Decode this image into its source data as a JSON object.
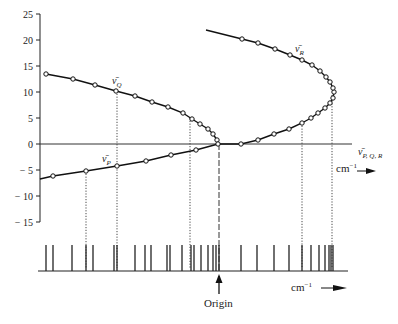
{
  "chart_data": {
    "type": "line",
    "title": "",
    "xlabel": "ν̄ P, Q, R  (cm⁻¹ →)",
    "ylabel": "",
    "ylim": [
      -15,
      25
    ],
    "y_ticks": [
      25,
      20,
      15,
      10,
      5,
      0,
      -5,
      -10,
      -15
    ],
    "grid": false,
    "legend": "inline labels",
    "annotations": [
      "ν̄Q",
      "ν̄R",
      "ν̄P",
      "ν̄P, Q, R",
      "cm⁻¹",
      "Origin"
    ],
    "series": [
      {
        "name": "ν̄Q",
        "points_px": [
          [
            46,
            74
          ],
          [
            73,
            79
          ],
          [
            95,
            85
          ],
          [
            116,
            91
          ],
          [
            135,
            96
          ],
          [
            152,
            102
          ],
          [
            168,
            107
          ],
          [
            183,
            113
          ],
          [
            192,
            119
          ],
          [
            200,
            124
          ],
          [
            208,
            129
          ],
          [
            213,
            134
          ],
          [
            217,
            140
          ]
        ],
        "points_y": [
          13.5,
          12.5,
          11.3,
          10.2,
          9.2,
          8.0,
          7.1,
          5.9,
          4.8,
          3.8,
          2.9,
          1.9,
          0.8
        ]
      },
      {
        "name": "ν̄R",
        "points_px": [
          [
            219,
            144
          ],
          [
            241,
            144
          ],
          [
            258,
            140
          ],
          [
            274,
            134
          ],
          [
            289,
            129
          ],
          [
            302,
            123
          ],
          [
            311,
            118
          ],
          [
            318,
            113
          ],
          [
            325,
            108
          ],
          [
            330,
            103
          ],
          [
            333,
            98
          ],
          [
            334,
            92
          ],
          [
            333,
            88
          ],
          [
            330,
            82
          ],
          [
            326,
            77
          ],
          [
            320,
            71
          ],
          [
            312,
            65
          ],
          [
            302,
            60
          ],
          [
            290,
            55
          ],
          [
            275,
            49
          ],
          [
            258,
            43
          ],
          [
            242,
            39
          ],
          [
            206,
            30
          ]
        ],
        "points_y": [
          0,
          0.9,
          0.8,
          1.9,
          2.9,
          4.0,
          5.0,
          6.0,
          6.9,
          7.9,
          8.8,
          10.0,
          10.8,
          11.9,
          12.9,
          14.0,
          15.2,
          16.2,
          17.1,
          18.3,
          19.4,
          20.2,
          21.9
        ]
      },
      {
        "name": "ν̄P",
        "points_px": [
          [
            40,
            179
          ],
          [
            53,
            176
          ],
          [
            86,
            171
          ],
          [
            117,
            166
          ],
          [
            146,
            161
          ],
          [
            171,
            155
          ],
          [
            196,
            150
          ],
          [
            218,
            144
          ]
        ],
        "points_y": [
          -6.7,
          -6.2,
          -5.2,
          -4.2,
          -3.3,
          -2.1,
          -1.2,
          0
        ]
      }
    ],
    "spectrum_lines_px": [
      46,
      53,
      72,
      86,
      93,
      114,
      117,
      135,
      145,
      151,
      167,
      170,
      182,
      191,
      194,
      201,
      208,
      213,
      216,
      219,
      241,
      257,
      274,
      289,
      302,
      311,
      319,
      325,
      329,
      331,
      333
    ],
    "dotted_guides_px": [
      86,
      117,
      190,
      302,
      332
    ],
    "origin_px": 219
  },
  "axis": {
    "y_labels": [
      "25",
      "20",
      "15",
      "10",
      "5",
      "0",
      "− 5",
      "− 10",
      "− 15"
    ]
  },
  "labels": {
    "q": "ν̄",
    "q_sub": "Q",
    "r": "ν̄",
    "r_sub": "R",
    "p": "ν̄",
    "p_sub": "P",
    "pqr": "ν̄",
    "pqr_sub": "P, Q, R",
    "unit_upper": "cm",
    "unit_upper_sup": "−1",
    "unit_lower": "cm",
    "unit_lower_sup": "−1",
    "origin": "Origin"
  }
}
